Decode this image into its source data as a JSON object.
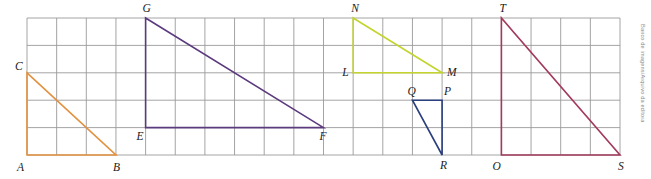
{
  "figure": {
    "credit": "Banco de imagens/Arquivo da editora",
    "background_color": "#ffffff"
  },
  "grid": {
    "columns": 20,
    "rows": 5,
    "origin_x": 27,
    "origin_y": 18,
    "cell_width": 29.65,
    "cell_height": 27.4,
    "line_color": "#9a9a9a",
    "line_width": 0.9
  },
  "triangles": [
    {
      "name": "triangle-abc",
      "color": "#E2913F",
      "vertices": [
        {
          "label": "A",
          "col": 0,
          "row": 5,
          "label_dx": -10,
          "label_dy": 13
        },
        {
          "label": "B",
          "col": 3,
          "row": 5,
          "label_dx": -3,
          "label_dy": 13
        },
        {
          "label": "C",
          "col": 0,
          "row": 2,
          "label_dx": -12,
          "label_dy": -5
        }
      ]
    },
    {
      "name": "triangle-efg",
      "color": "#5B3A7E",
      "vertices": [
        {
          "label": "E",
          "col": 4,
          "row": 4,
          "label_dx": -9,
          "label_dy": 10
        },
        {
          "label": "F",
          "col": 10,
          "row": 4,
          "label_dx": -4,
          "label_dy": 10
        },
        {
          "label": "G",
          "col": 4,
          "row": 0,
          "label_dx": -3,
          "label_dy": -9
        }
      ]
    },
    {
      "name": "triangle-lmn",
      "color": "#C3D42E",
      "vertices": [
        {
          "label": "L",
          "col": 11,
          "row": 2,
          "label_dx": -11,
          "label_dy": 1
        },
        {
          "label": "M",
          "col": 14,
          "row": 2,
          "label_dx": 5,
          "label_dy": 1
        },
        {
          "label": "N",
          "col": 11,
          "row": 0,
          "label_dx": -2,
          "label_dy": -9
        }
      ]
    },
    {
      "name": "triangle-pqr",
      "color": "#2B3F7E",
      "vertices": [
        {
          "label": "Q",
          "col": 13,
          "row": 3,
          "label_dx": -5,
          "label_dy": -8
        },
        {
          "label": "P",
          "col": 14,
          "row": 3,
          "label_dx": 2,
          "label_dy": -8
        },
        {
          "label": "R",
          "col": 14,
          "row": 5,
          "label_dx": -2,
          "label_dy": 11
        }
      ]
    },
    {
      "name": "triangle-ost",
      "color": "#A33A5B",
      "vertices": [
        {
          "label": "O",
          "col": 16,
          "row": 5,
          "label_dx": -9,
          "label_dy": 12
        },
        {
          "label": "S",
          "col": 20,
          "row": 5,
          "label_dx": -2,
          "label_dy": 12
        },
        {
          "label": "T",
          "col": 16,
          "row": 0,
          "label_dx": -2,
          "label_dy": -9
        }
      ]
    }
  ]
}
